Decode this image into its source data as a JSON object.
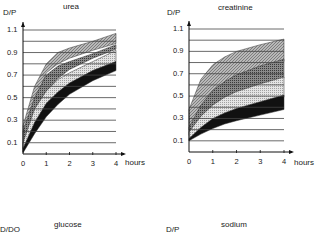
{
  "chart_data": [
    {
      "type": "area",
      "title": "urea",
      "ylabel": "D/P",
      "xlabel": "hours",
      "x_ticks": [
        "0",
        "1",
        "2",
        "3",
        "4"
      ],
      "y_ticks": [
        "1.1",
        "0.9",
        "0.7",
        "0.5",
        "0.3",
        "0.1"
      ],
      "ylim": [
        0,
        1.1
      ],
      "xlim": [
        0,
        4
      ],
      "grid": "horizontal every 0.1",
      "x": [
        0,
        0.5,
        1,
        1.5,
        2,
        3,
        4
      ],
      "bands": [
        {
          "name": "band-1 (dark hatch)",
          "lower": [
            0.05,
            0.45,
            0.72,
            0.8,
            0.85,
            0.92,
            0.98
          ],
          "upper": [
            0.25,
            0.6,
            0.8,
            0.9,
            0.94,
            1.0,
            1.07
          ],
          "fill": "#9a9a9a"
        },
        {
          "name": "band-2 (cross hatch)",
          "lower": [
            0.02,
            0.35,
            0.55,
            0.67,
            0.75,
            0.85,
            0.93
          ],
          "upper": [
            0.2,
            0.5,
            0.7,
            0.78,
            0.82,
            0.89,
            0.97
          ],
          "fill": "#6e6e6e"
        },
        {
          "name": "band-3 (light dots)",
          "lower": [
            0.02,
            0.25,
            0.42,
            0.53,
            0.62,
            0.74,
            0.82
          ],
          "upper": [
            0.1,
            0.4,
            0.56,
            0.66,
            0.72,
            0.82,
            0.92
          ],
          "fill": "#cfcfcf"
        },
        {
          "name": "band-4 (solid black)",
          "lower": [
            0.01,
            0.18,
            0.33,
            0.44,
            0.53,
            0.65,
            0.74
          ],
          "upper": [
            0.05,
            0.28,
            0.45,
            0.55,
            0.63,
            0.74,
            0.82
          ],
          "fill": "#111111"
        }
      ]
    },
    {
      "type": "area",
      "title": "creatinine",
      "ylabel": "D/P",
      "xlabel": "hours",
      "x_ticks": [
        "0",
        "1",
        "2",
        "3",
        "4"
      ],
      "y_ticks": [
        "1.1",
        "0.9",
        "0.7",
        "0.5",
        "0.3",
        "0.1"
      ],
      "ylim": [
        0,
        1.1
      ],
      "xlim": [
        0,
        4
      ],
      "grid": "horizontal every 0.1",
      "x": [
        0,
        0.5,
        1,
        1.5,
        2,
        3,
        4
      ],
      "bands": [
        {
          "name": "band-1 (dark hatch)",
          "lower": [
            0.2,
            0.4,
            0.52,
            0.6,
            0.66,
            0.74,
            0.81
          ],
          "upper": [
            0.38,
            0.65,
            0.78,
            0.85,
            0.9,
            0.96,
            1.01
          ],
          "fill": "#9a9a9a"
        },
        {
          "name": "band-2 (cross hatch)",
          "lower": [
            0.15,
            0.3,
            0.4,
            0.47,
            0.52,
            0.6,
            0.66
          ],
          "upper": [
            0.22,
            0.42,
            0.55,
            0.63,
            0.69,
            0.77,
            0.83
          ],
          "fill": "#6e6e6e"
        },
        {
          "name": "band-3 (light dots)",
          "lower": [
            0.1,
            0.2,
            0.27,
            0.32,
            0.36,
            0.43,
            0.49
          ],
          "upper": [
            0.18,
            0.32,
            0.42,
            0.49,
            0.54,
            0.61,
            0.67
          ],
          "fill": "#cfcfcf"
        },
        {
          "name": "band-4 (solid black)",
          "lower": [
            0.1,
            0.16,
            0.21,
            0.25,
            0.28,
            0.33,
            0.38
          ],
          "upper": [
            0.12,
            0.22,
            0.3,
            0.35,
            0.39,
            0.45,
            0.51
          ],
          "fill": "#111111"
        }
      ]
    }
  ],
  "bottom_panels": [
    {
      "title": "glucose",
      "ylabel": "D/DO"
    },
    {
      "title": "sodium",
      "ylabel": "D/P"
    }
  ],
  "labels": {
    "urea_title": "urea",
    "urea_ylabel": "D/P",
    "creat_title": "creatinine",
    "creat_ylabel": "D/P",
    "xlabel": "hours",
    "glucose_title": "glucose",
    "glucose_ylabel": "D/DO",
    "sodium_title": "sodium",
    "sodium_ylabel": "D/P"
  }
}
